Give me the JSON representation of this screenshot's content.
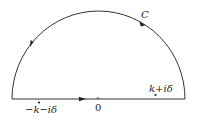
{
  "diagram": {
    "contour_label": "C",
    "origin_label": "0",
    "pole_upper_label": "k+iδ",
    "pole_lower_label": "−k−iδ",
    "colors": {
      "stroke": "#333333",
      "background": "#ffffff"
    }
  }
}
